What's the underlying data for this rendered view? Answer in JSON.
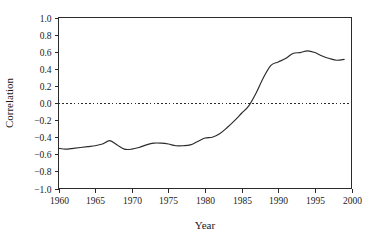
{
  "chart_data": {
    "type": "line",
    "title": "",
    "xlabel": "Year",
    "ylabel": "Correlation",
    "xlim": [
      1960,
      2000
    ],
    "ylim": [
      -1.0,
      1.0
    ],
    "grid": false,
    "legend": null,
    "annotations": [
      {
        "kind": "horizontal-reference-line",
        "value": 0.0,
        "style": "dotted"
      }
    ],
    "xticks": [
      1960,
      1965,
      1970,
      1975,
      1980,
      1985,
      1990,
      1995,
      2000
    ],
    "xtick_labels": [
      "1960",
      "1965",
      "1970",
      "1975",
      "1980",
      "1985",
      "1990",
      "1995",
      "2000"
    ],
    "yticks": [
      -1.0,
      -0.8,
      -0.6,
      -0.4,
      -0.2,
      0.0,
      0.2,
      0.4,
      0.6,
      0.8,
      1.0
    ],
    "ytick_labels": [
      "−1.0",
      "−0.8",
      "−0.6",
      "−0.4",
      "−0.2",
      "0.0",
      "0.2",
      "0.4",
      "0.6",
      "0.8",
      "1.0"
    ],
    "line_color": "#2b2b2b",
    "series": [
      {
        "name": "Correlation",
        "x": [
          1960,
          1961,
          1962,
          1963,
          1964,
          1965,
          1966,
          1967,
          1968,
          1969,
          1970,
          1971,
          1972,
          1973,
          1974,
          1975,
          1976,
          1977,
          1978,
          1979,
          1980,
          1981,
          1982,
          1983,
          1984,
          1985,
          1986,
          1987,
          1988,
          1989,
          1990,
          1991,
          1992,
          1993,
          1994,
          1995,
          1996,
          1997,
          1998,
          1999
        ],
        "values": [
          -0.53,
          -0.54,
          -0.53,
          -0.52,
          -0.51,
          -0.5,
          -0.48,
          -0.44,
          -0.49,
          -0.54,
          -0.54,
          -0.52,
          -0.49,
          -0.47,
          -0.47,
          -0.48,
          -0.5,
          -0.5,
          -0.49,
          -0.45,
          -0.41,
          -0.4,
          -0.36,
          -0.29,
          -0.21,
          -0.12,
          -0.03,
          0.12,
          0.3,
          0.44,
          0.48,
          0.52,
          0.58,
          0.59,
          0.61,
          0.59,
          0.55,
          0.52,
          0.5,
          0.51
        ]
      }
    ]
  },
  "axes": {
    "x_title": "Year",
    "y_title": "Correlation"
  }
}
